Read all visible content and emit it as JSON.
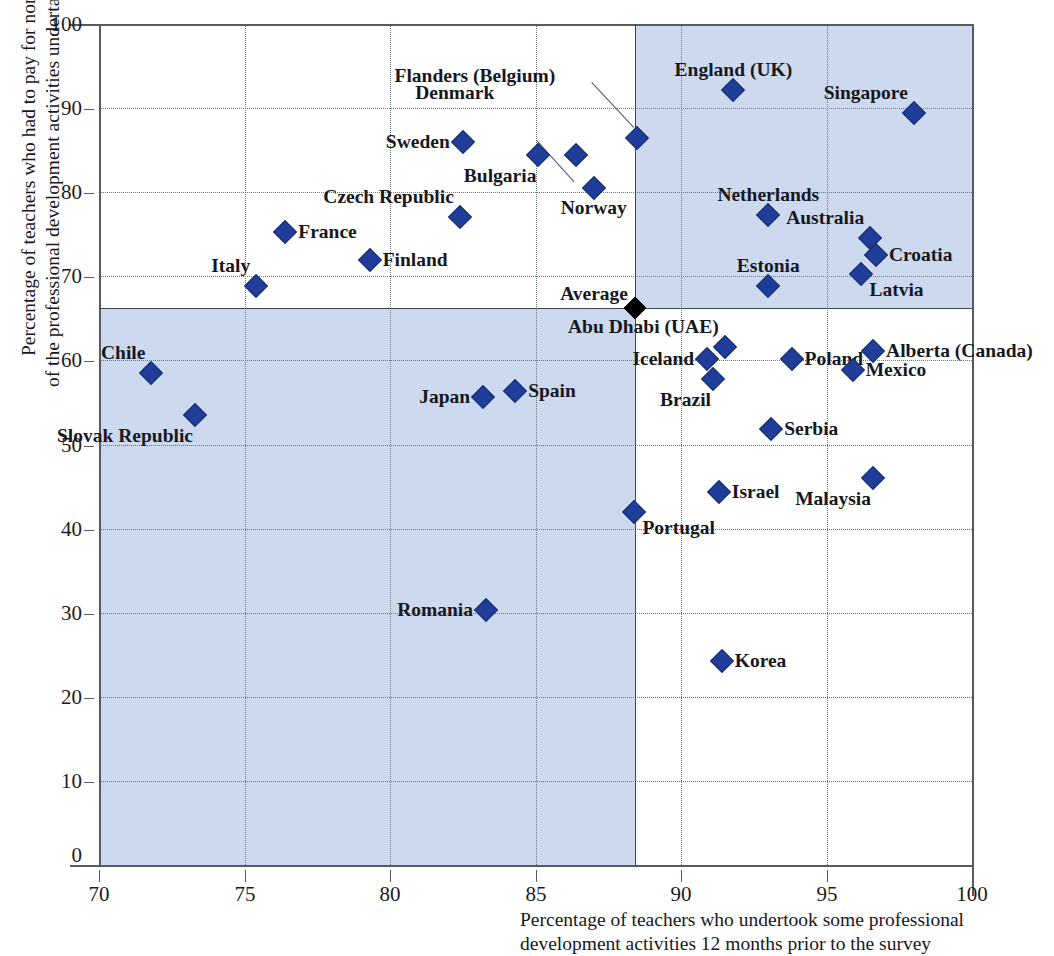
{
  "chart_data": {
    "type": "scatter",
    "title": "",
    "xlabel": "Percentage of teachers who undertook some professional development activities 12 months prior to the survey",
    "ylabel": "Percentage of teachers who had to pay for none of the professional development activities undertaken",
    "xlim": [
      70,
      100
    ],
    "ylim": [
      0,
      100
    ],
    "xticks": [
      70,
      75,
      80,
      85,
      90,
      95,
      100
    ],
    "yticks": [
      0,
      10,
      20,
      30,
      40,
      50,
      60,
      70,
      80,
      90,
      100
    ],
    "grid": true,
    "legend": "none",
    "marker_color": "#1f3d99",
    "shade_color": "#cdd9ef",
    "average_marker_color": "#000000",
    "average_label": "Average",
    "average_x": 88.4,
    "average_y": 66.2,
    "points": [
      {
        "name": "Chile",
        "x": 71.8,
        "y": 58.5,
        "label_pos": "above-left"
      },
      {
        "name": "Slovak Republic",
        "x": 73.3,
        "y": 53.5,
        "label_pos": "below-left"
      },
      {
        "name": "Italy",
        "x": 75.4,
        "y": 68.8,
        "label_pos": "above-left"
      },
      {
        "name": "France",
        "x": 76.4,
        "y": 75.3,
        "label_pos": "right"
      },
      {
        "name": "Finland",
        "x": 79.3,
        "y": 71.9,
        "label_pos": "right"
      },
      {
        "name": "Czech Republic",
        "x": 82.4,
        "y": 77.0,
        "label_pos": "above-left"
      },
      {
        "name": "Sweden",
        "x": 82.5,
        "y": 86.0,
        "label_pos": "left"
      },
      {
        "name": "Japan",
        "x": 83.2,
        "y": 55.6,
        "label_pos": "left"
      },
      {
        "name": "Romania",
        "x": 83.3,
        "y": 30.3,
        "label_pos": "left"
      },
      {
        "name": "Spain",
        "x": 84.3,
        "y": 56.4,
        "label_pos": "right"
      },
      {
        "name": "Bulgaria",
        "x": 85.1,
        "y": 84.4,
        "label_pos": "below-left"
      },
      {
        "name": "Denmark",
        "x": 86.4,
        "y": 84.4,
        "label_pos": "leader-upleft"
      },
      {
        "name": "Norway",
        "x": 87.0,
        "y": 80.5,
        "label_pos": "below"
      },
      {
        "name": "Flanders (Belgium)",
        "x": 88.5,
        "y": 86.4,
        "label_pos": "leader-upleft"
      },
      {
        "name": "Portugal",
        "x": 88.4,
        "y": 42.0,
        "label_pos": "below-right"
      },
      {
        "name": "Iceland",
        "x": 90.9,
        "y": 60.2,
        "label_pos": "left"
      },
      {
        "name": "Abu Dhabi (UAE)",
        "x": 91.5,
        "y": 61.6,
        "label_pos": "above-left"
      },
      {
        "name": "Brazil",
        "x": 91.1,
        "y": 57.8,
        "label_pos": "below-left"
      },
      {
        "name": "Israel",
        "x": 91.3,
        "y": 44.3,
        "label_pos": "right"
      },
      {
        "name": "Korea",
        "x": 91.4,
        "y": 24.3,
        "label_pos": "right"
      },
      {
        "name": "England (UK)",
        "x": 91.8,
        "y": 92.1,
        "label_pos": "above"
      },
      {
        "name": "Netherlands",
        "x": 93.0,
        "y": 77.3,
        "label_pos": "above"
      },
      {
        "name": "Estonia",
        "x": 93.0,
        "y": 68.9,
        "label_pos": "above"
      },
      {
        "name": "Serbia",
        "x": 93.1,
        "y": 51.8,
        "label_pos": "right"
      },
      {
        "name": "Poland",
        "x": 93.8,
        "y": 60.2,
        "label_pos": "right"
      },
      {
        "name": "Mexico",
        "x": 95.9,
        "y": 58.9,
        "label_pos": "right"
      },
      {
        "name": "Australia",
        "x": 96.5,
        "y": 74.5,
        "label_pos": "above-left"
      },
      {
        "name": "Croatia",
        "x": 96.7,
        "y": 72.5,
        "label_pos": "right"
      },
      {
        "name": "Latvia",
        "x": 96.2,
        "y": 70.3,
        "label_pos": "below-right"
      },
      {
        "name": "Alberta (Canada)",
        "x": 96.6,
        "y": 61.1,
        "label_pos": "right"
      },
      {
        "name": "Malaysia",
        "x": 96.6,
        "y": 46.0,
        "label_pos": "below-left"
      },
      {
        "name": "Singapore",
        "x": 98.0,
        "y": 89.4,
        "label_pos": "above-left"
      }
    ]
  },
  "axis": {
    "x_tick_labels": [
      "70",
      "75",
      "80",
      "85",
      "90",
      "95",
      "100"
    ],
    "y_tick_labels": [
      "0",
      "10",
      "20",
      "30",
      "40",
      "50",
      "60",
      "70",
      "80",
      "90",
      "100"
    ],
    "x_title_line1": "Percentage of teachers who undertook some professional",
    "x_title_line2": "development activities 12 months prior to the survey",
    "y_title_line1": "Percentage of teachers who had to pay for none",
    "y_title_line2": "of the professional development activities undertaken"
  }
}
